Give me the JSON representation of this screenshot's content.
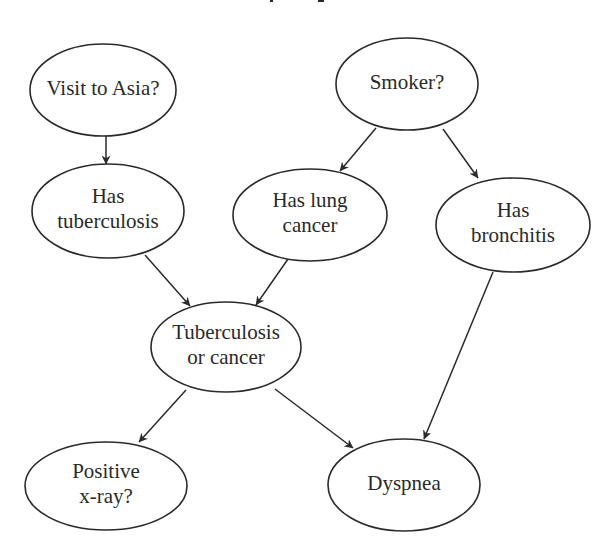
{
  "diagram": {
    "type": "bayesian-network",
    "colors": {
      "background": "#ffffff",
      "stroke": "#2a2a2a",
      "text": "#2a2a2a"
    },
    "nodes": [
      {
        "id": "asia",
        "lines": [
          "Visit to Asia?"
        ],
        "cx": 103,
        "cy": 90,
        "rx": 73,
        "ry": 46
      },
      {
        "id": "smoker",
        "lines": [
          "Smoker?"
        ],
        "cx": 407,
        "cy": 84,
        "rx": 71,
        "ry": 46
      },
      {
        "id": "tuberculosis",
        "lines": [
          "Has",
          "tuberculosis"
        ],
        "cx": 108,
        "cy": 211,
        "rx": 76,
        "ry": 47
      },
      {
        "id": "lung_cancer",
        "lines": [
          "Has lung",
          "cancer"
        ],
        "cx": 310,
        "cy": 215,
        "rx": 77,
        "ry": 46
      },
      {
        "id": "bronchitis",
        "lines": [
          "Has",
          "bronchitis"
        ],
        "cx": 513,
        "cy": 225,
        "rx": 77,
        "ry": 47
      },
      {
        "id": "tb_or_cancer",
        "lines": [
          "Tuberculosis",
          "or cancer"
        ],
        "cx": 226,
        "cy": 347,
        "rx": 75,
        "ry": 45
      },
      {
        "id": "xray",
        "lines": [
          "Positive",
          "x-ray?"
        ],
        "cx": 106,
        "cy": 486,
        "rx": 81,
        "ry": 44
      },
      {
        "id": "dyspnea",
        "lines": [
          "Dyspnea"
        ],
        "cx": 404,
        "cy": 485,
        "rx": 76,
        "ry": 46
      }
    ],
    "edges": [
      {
        "from": "asia",
        "to": "tuberculosis",
        "x1": 106,
        "y1": 136,
        "x2": 106,
        "y2": 164
      },
      {
        "from": "smoker",
        "to": "lung_cancer",
        "x1": 376,
        "y1": 128,
        "x2": 340,
        "y2": 171
      },
      {
        "from": "smoker",
        "to": "bronchitis",
        "x1": 443,
        "y1": 129,
        "x2": 478,
        "y2": 178
      },
      {
        "from": "tuberculosis",
        "to": "tb_or_cancer",
        "x1": 145,
        "y1": 255,
        "x2": 190,
        "y2": 306
      },
      {
        "from": "lung_cancer",
        "to": "tb_or_cancer",
        "x1": 288,
        "y1": 259,
        "x2": 256,
        "y2": 305
      },
      {
        "from": "bronchitis",
        "to": "dyspnea",
        "x1": 493,
        "y1": 272,
        "x2": 424,
        "y2": 439
      },
      {
        "from": "tb_or_cancer",
        "to": "xray",
        "x1": 186,
        "y1": 390,
        "x2": 139,
        "y2": 442
      },
      {
        "from": "tb_or_cancer",
        "to": "dyspnea",
        "x1": 275,
        "y1": 389,
        "x2": 353,
        "y2": 448
      }
    ]
  }
}
